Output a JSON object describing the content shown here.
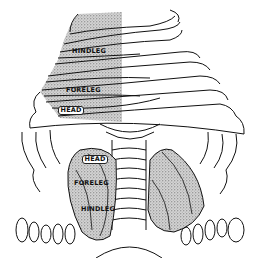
{
  "figure": {
    "stipple_color": "#8a8a8a",
    "line_color": "#111111",
    "labels": {
      "upper": [
        {
          "id": "hindleg",
          "text": "HINDLEG"
        },
        {
          "id": "foreleg",
          "text": "FORELEG"
        },
        {
          "id": "head",
          "text": "HEAD"
        }
      ],
      "lower": [
        {
          "id": "head",
          "text": "HEAD"
        },
        {
          "id": "foreleg",
          "text": "FORELEG"
        },
        {
          "id": "hindleg",
          "text": "HINDLEG"
        }
      ]
    }
  }
}
